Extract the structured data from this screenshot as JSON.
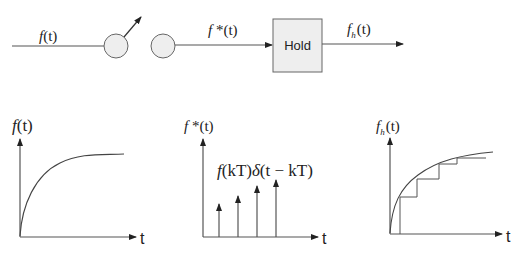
{
  "diagram": {
    "top": {
      "input_label": {
        "func": "f",
        "arg": "(t)"
      },
      "sampled_label": {
        "func": "f",
        "star": " *",
        "arg": "(t)"
      },
      "hold_block": {
        "label": "Hold",
        "fill": "#eeeeee",
        "stroke": "#666666"
      },
      "output_label": {
        "func": "f",
        "sub": "h",
        "arg": "(t)"
      }
    },
    "plots": [
      {
        "name": "continuous",
        "ylabel": {
          "func": "f",
          "arg": "(t)"
        },
        "xlabel": "t"
      },
      {
        "name": "sampled",
        "ylabel": {
          "func": "f",
          "star": " *",
          "arg": "(t)"
        },
        "xlabel": "t",
        "annotation": {
          "f": "f",
          "a1": "(kT)",
          "delta": "δ",
          "a2": "(t − kT)"
        }
      },
      {
        "name": "held",
        "ylabel": {
          "func": "f",
          "sub": "h",
          "arg": "(t)"
        },
        "xlabel": "t"
      }
    ]
  }
}
